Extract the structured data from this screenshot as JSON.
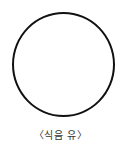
{
  "figure": {
    "shape": "circle",
    "stroke_color": "#111111",
    "fill_color": "#ffffff",
    "caption": "〈식음 유〉"
  }
}
